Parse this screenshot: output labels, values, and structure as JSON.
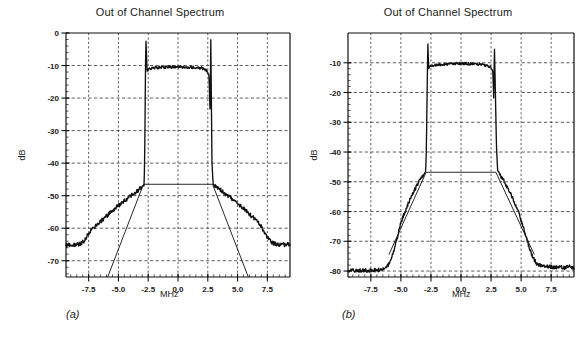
{
  "figure": {
    "caption_a": "(a)",
    "caption_b": "(b)"
  },
  "panels": [
    {
      "id": "a",
      "title": "Out of Channel Spectrum",
      "xlabel": "MHz",
      "ylabel": "dB"
    },
    {
      "id": "b",
      "title": "Out of Channel Spectrum",
      "xlabel": "MHz",
      "ylabel": "dB"
    }
  ],
  "chart_data": [
    {
      "type": "line",
      "panel": "a",
      "title": "Out of Channel Spectrum",
      "xlabel": "MHz",
      "ylabel": "dB",
      "xlim": [
        -9.4,
        9.4
      ],
      "ylim": [
        -75,
        0
      ],
      "xticks": [
        -7.5,
        -5.0,
        -2.5,
        0.0,
        2.5,
        5.0,
        7.5
      ],
      "xticklabels": [
        "-7.5",
        "-5.0",
        "-2.5",
        "0.0",
        "2.5",
        "5.0",
        "7.5"
      ],
      "yticks": [
        0,
        -10,
        -20,
        -30,
        -40,
        -50,
        -60,
        -70
      ],
      "yticklabels": [
        "0",
        "-10",
        "-20",
        "-30",
        "-40",
        "-50",
        "-60",
        "-70"
      ],
      "grid": true,
      "grid_style": "dashed",
      "legend": null,
      "series": [
        {
          "name": "measured spectrum",
          "style": "thick-noisy",
          "x": [
            -9.4,
            -9.0,
            -8.6,
            -8.2,
            -7.9,
            -7.6,
            -7.3,
            -7.0,
            -6.7,
            -6.4,
            -6.1,
            -5.8,
            -5.5,
            -5.2,
            -4.9,
            -4.6,
            -4.3,
            -4.0,
            -3.7,
            -3.4,
            -3.1,
            -2.95,
            -2.85,
            -2.8,
            -2.75,
            -2.7,
            -2.6,
            -2.4,
            -2.0,
            -1.5,
            -1.0,
            -0.5,
            0.0,
            0.5,
            1.0,
            1.5,
            2.0,
            2.4,
            2.6,
            2.7,
            2.75,
            2.8,
            2.85,
            2.95,
            3.1,
            3.4,
            3.7,
            4.0,
            4.3,
            4.6,
            4.9,
            5.2,
            5.5,
            5.8,
            6.1,
            6.4,
            6.7,
            7.0,
            7.3,
            7.6,
            7.9,
            8.2,
            8.6,
            9.0,
            9.4
          ],
          "y": [
            -65.3,
            -65.0,
            -65.2,
            -64.8,
            -64.0,
            -62.2,
            -60.6,
            -59.6,
            -58.6,
            -57.6,
            -56.6,
            -55.6,
            -54.6,
            -53.6,
            -52.7,
            -51.8,
            -51.0,
            -50.2,
            -49.4,
            -48.6,
            -47.5,
            -47.0,
            -46.8,
            -40.0,
            -20.0,
            -1.0,
            -11.8,
            -11.0,
            -10.7,
            -10.6,
            -10.5,
            -10.4,
            -10.4,
            -10.5,
            -10.5,
            -10.6,
            -10.8,
            -11.5,
            -13.0,
            -25.0,
            -1.0,
            -20.0,
            -40.0,
            -46.5,
            -46.9,
            -47.6,
            -48.6,
            -49.6,
            -50.4,
            -51.3,
            -52.2,
            -53.1,
            -54.0,
            -55.0,
            -56.0,
            -57.0,
            -58.2,
            -59.6,
            -61.6,
            -63.4,
            -64.4,
            -64.9,
            -65.0,
            -65.1,
            -64.9
          ]
        },
        {
          "name": "spectral mask",
          "style": "thin-line",
          "x": [
            -5.9,
            -2.9,
            2.9,
            5.9
          ],
          "y": [
            -75.0,
            -46.5,
            -46.5,
            -75.0
          ]
        }
      ]
    },
    {
      "type": "line",
      "panel": "b",
      "title": "Out of Channel Spectrum",
      "xlabel": "MHz",
      "ylabel": "dB",
      "xlim": [
        -9.4,
        9.4
      ],
      "ylim": [
        -82,
        0
      ],
      "xticks": [
        -7.5,
        -5.0,
        -2.5,
        0.0,
        2.5,
        5.0,
        7.5
      ],
      "xticklabels": [
        "-7.5",
        "-5.0",
        "-2.5",
        "0.0",
        "2.5",
        "5.0",
        "7.5"
      ],
      "yticks": [
        -10,
        -20,
        -30,
        -40,
        -50,
        -60,
        -70,
        -80
      ],
      "yticklabels": [
        "-10",
        "-20",
        "-30",
        "-40",
        "-50",
        "-60",
        "-70",
        "-80"
      ],
      "grid": true,
      "grid_style": "dashed",
      "legend": null,
      "series": [
        {
          "name": "measured spectrum",
          "style": "thick-noisy",
          "x": [
            -9.4,
            -9.0,
            -8.6,
            -8.2,
            -7.8,
            -7.4,
            -7.0,
            -6.6,
            -6.3,
            -6.0,
            -5.8,
            -5.6,
            -5.4,
            -5.2,
            -5.0,
            -4.7,
            -4.4,
            -4.1,
            -3.8,
            -3.5,
            -3.2,
            -3.0,
            -2.95,
            -2.9,
            -2.85,
            -2.8,
            -2.75,
            -2.7,
            -2.6,
            -2.4,
            -2.0,
            -1.5,
            -1.0,
            -0.5,
            0.0,
            0.5,
            1.0,
            1.5,
            2.0,
            2.3,
            2.5,
            2.65,
            2.72,
            2.78,
            2.85,
            2.95,
            3.05,
            3.2,
            3.5,
            3.8,
            4.1,
            4.4,
            4.7,
            5.0,
            5.2,
            5.4,
            5.6,
            5.8,
            6.0,
            6.3,
            6.6,
            7.0,
            7.4,
            7.8,
            8.2,
            8.6,
            9.0,
            9.4
          ],
          "y": [
            -80.0,
            -79.8,
            -80.0,
            -79.7,
            -79.9,
            -79.6,
            -79.8,
            -79.4,
            -78.8,
            -77.6,
            -75.8,
            -73.2,
            -70.2,
            -67.0,
            -63.8,
            -60.4,
            -57.4,
            -54.6,
            -52.2,
            -50.0,
            -48.0,
            -47.0,
            -46.8,
            -43.0,
            -30.0,
            -14.0,
            -3.0,
            -12.0,
            -11.2,
            -10.9,
            -10.7,
            -10.5,
            -10.4,
            -10.3,
            -10.2,
            -10.3,
            -10.4,
            -10.5,
            -10.8,
            -11.2,
            -11.6,
            -13.0,
            -22.0,
            -4.0,
            -18.0,
            -38.0,
            -46.6,
            -47.4,
            -49.2,
            -51.4,
            -53.8,
            -56.4,
            -59.4,
            -62.8,
            -65.4,
            -68.2,
            -71.0,
            -73.6,
            -75.6,
            -77.4,
            -78.2,
            -78.6,
            -78.4,
            -78.8,
            -78.5,
            -78.9,
            -78.4,
            -79.0
          ]
        },
        {
          "name": "spectral mask",
          "style": "thin-line",
          "x": [
            -6.0,
            -2.9,
            2.9,
            6.1
          ],
          "y": [
            -74.5,
            -46.8,
            -46.8,
            -74.5
          ]
        }
      ]
    }
  ]
}
